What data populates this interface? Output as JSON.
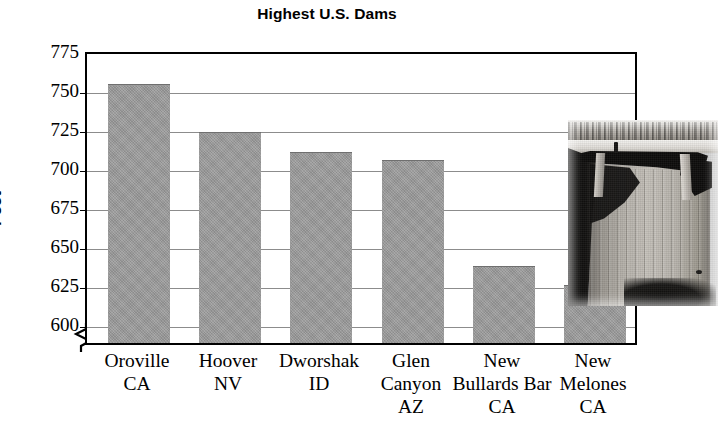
{
  "chart_data": {
    "type": "bar",
    "title": "Highest U.S. Dams",
    "xlabel": "",
    "ylabel": "Feet",
    "ylim": [
      590,
      775
    ],
    "yticks": [
      600,
      625,
      650,
      675,
      700,
      725,
      750,
      775
    ],
    "ytick_labels": [
      "600",
      "625",
      "650",
      "675",
      "700",
      "725",
      "750",
      "775"
    ],
    "axis_break": true,
    "grid": true,
    "legend": null,
    "bar_color": "#979797",
    "categories": [
      "Oroville\nCA",
      "Hoover\nNV",
      "Dworshak\nID",
      "Glen\nCanyon\nAZ",
      "New\nBullards Bar\nCA",
      "New\nMelones\nCA"
    ],
    "category_lines": [
      [
        "Oroville",
        "CA"
      ],
      [
        "Hoover",
        "NV"
      ],
      [
        "Dworshak",
        "ID"
      ],
      [
        "Glen",
        "Canyon",
        "AZ"
      ],
      [
        "New",
        "Bullards Bar",
        "CA"
      ],
      [
        "New",
        "Melones",
        "CA"
      ]
    ],
    "values": [
      756,
      725,
      712,
      707,
      639,
      627
    ],
    "series": [
      {
        "name": "Height",
        "values": [
          756,
          725,
          712,
          707,
          639,
          627
        ]
      }
    ]
  },
  "figure": {
    "title": "Highest U.S. Dams",
    "y_axis_title": "Feet"
  },
  "photo": {
    "caption": "",
    "alt_name": "dam-photograph"
  }
}
